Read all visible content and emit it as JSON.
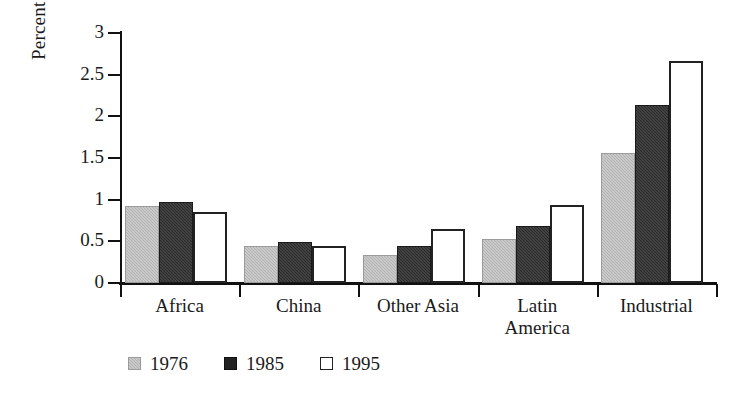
{
  "chart_data": {
    "type": "bar",
    "title": "",
    "subtitle": "",
    "xlabel": "",
    "ylabel": "Percent Ag. GDP",
    "categories": [
      "Africa",
      "China",
      "Other Asia",
      "Latin America",
      "Industrial"
    ],
    "series": [
      {
        "name": "1976",
        "color": "#b2b2b2",
        "values": [
          0.93,
          0.45,
          0.34,
          0.53,
          1.56
        ]
      },
      {
        "name": "1985",
        "color": "#2b2b2b",
        "values": [
          0.97,
          0.49,
          0.44,
          0.69,
          2.14
        ]
      },
      {
        "name": "1995",
        "color": "#ffffff",
        "values": [
          0.85,
          0.45,
          0.65,
          0.94,
          2.67
        ]
      }
    ],
    "ylim": [
      0,
      3
    ],
    "yticks": [
      0,
      0.5,
      1,
      1.5,
      2,
      2.5,
      3
    ],
    "ytick_labels": [
      "0",
      "0.5",
      "1",
      "1.5",
      "2",
      "2.5",
      "3"
    ],
    "grid": false,
    "legend_position": "bottom-left",
    "legend_entries": [
      "1976",
      "1985",
      "1995"
    ],
    "annotations": []
  },
  "category_label_lines": [
    [
      "Africa"
    ],
    [
      "China"
    ],
    [
      "Other Asia"
    ],
    [
      "Latin",
      "America"
    ],
    [
      "Industrial"
    ]
  ]
}
